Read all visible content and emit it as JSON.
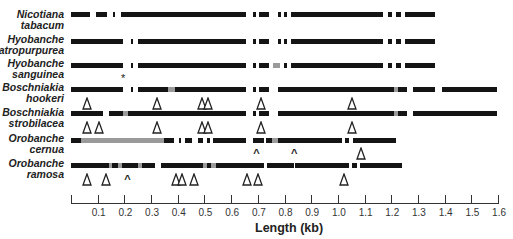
{
  "figure": {
    "xlabel": "Length (kb)",
    "scale": {
      "x0_px": 71,
      "px_per_kb": 266.9
    },
    "axis_ticks": [
      "0.1",
      "0.2",
      "0.3",
      "0.4",
      "0.5",
      "0.6",
      "0.7",
      "0.8",
      "0.9",
      "1.0",
      "1.1",
      "1.2",
      "1.3",
      "1.4",
      "1.5",
      "1.6"
    ],
    "axis_tick_values": [
      0.1,
      0.2,
      0.3,
      0.4,
      0.5,
      0.6,
      0.7,
      0.8,
      0.9,
      1.0,
      1.1,
      1.2,
      1.3,
      1.4,
      1.5,
      1.6
    ]
  },
  "taxa": [
    {
      "genus": "Nicotiana",
      "species": "tabacum",
      "label_top": 9,
      "bar_y": 14,
      "segments": [
        [
          0.0,
          0.09,
          "k"
        ],
        [
          0.115,
          0.165,
          "k"
        ],
        [
          0.195,
          0.205,
          "k"
        ],
        [
          0.23,
          0.4,
          "k"
        ],
        [
          0.4,
          0.81,
          "k"
        ],
        [
          0.84,
          0.855,
          "k"
        ],
        [
          0.87,
          0.915,
          "k"
        ],
        [
          0.955,
          0.97,
          "k"
        ],
        [
          0.985,
          1.0,
          "k"
        ],
        [
          1.015,
          1.04,
          "k"
        ],
        [
          1.04,
          1.44,
          "k"
        ],
        [
          1.465,
          1.485,
          "k"
        ],
        [
          1.5,
          1.525,
          "k"
        ],
        [
          1.545,
          1.68,
          "k"
        ]
      ],
      "markers": []
    },
    {
      "genus": "Hyobanche",
      "species": "atropurpurea",
      "label_top": 34,
      "bar_y": 41,
      "segments": [
        [
          0.0,
          0.24,
          "k"
        ],
        [
          0.275,
          0.285,
          "k"
        ],
        [
          0.31,
          0.49,
          "k"
        ],
        [
          0.49,
          0.81,
          "k"
        ],
        [
          0.84,
          0.855,
          "k"
        ],
        [
          0.87,
          0.915,
          "k"
        ],
        [
          0.955,
          0.97,
          "k"
        ],
        [
          0.985,
          1.0,
          "k"
        ],
        [
          1.015,
          1.04,
          "k"
        ],
        [
          1.04,
          1.44,
          "k"
        ],
        [
          1.465,
          1.485,
          "k"
        ],
        [
          1.5,
          1.525,
          "k"
        ],
        [
          1.545,
          1.68,
          "k"
        ]
      ],
      "markers": []
    },
    {
      "genus": "Hyobanche",
      "species": "sanguinea",
      "label_top": 58,
      "bar_y": 65,
      "segments": [
        [
          0.0,
          0.24,
          "k"
        ],
        [
          0.275,
          0.285,
          "k"
        ],
        [
          0.31,
          0.49,
          "k"
        ],
        [
          0.49,
          0.81,
          "k"
        ],
        [
          0.84,
          0.855,
          "k"
        ],
        [
          0.87,
          0.915,
          "k"
        ],
        [
          0.935,
          0.965,
          "g"
        ],
        [
          0.985,
          1.0,
          "k"
        ],
        [
          1.015,
          1.04,
          "k"
        ],
        [
          1.04,
          1.44,
          "k"
        ],
        [
          1.465,
          1.485,
          "k"
        ],
        [
          1.5,
          1.525,
          "k"
        ],
        [
          1.545,
          1.68,
          "k"
        ]
      ],
      "markers": [
        {
          "type": "star",
          "at": 0.245,
          "y": 73
        }
      ]
    },
    {
      "genus": "Boschniakia",
      "species": "hookeri",
      "label_top": 82,
      "bar_y": 89,
      "segments": [
        [
          0.0,
          0.24,
          "k"
        ],
        [
          0.275,
          0.285,
          "k"
        ],
        [
          0.31,
          0.45,
          "k"
        ],
        [
          0.45,
          0.48,
          "g"
        ],
        [
          0.48,
          0.81,
          "k"
        ],
        [
          0.84,
          0.855,
          "k"
        ],
        [
          0.87,
          0.915,
          "k"
        ],
        [
          0.955,
          1.28,
          "k"
        ],
        [
          1.28,
          1.49,
          "k"
        ],
        [
          1.49,
          1.51,
          "g"
        ],
        [
          1.51,
          1.55,
          "k"
        ],
        [
          1.58,
          1.68,
          "k"
        ],
        [
          1.715,
          1.97,
          "k"
        ]
      ],
      "markers": [
        {
          "type": "tri",
          "at": 0.075,
          "y": 96
        },
        {
          "type": "tri",
          "at": 0.395,
          "y": 96
        },
        {
          "type": "tri",
          "at": 0.605,
          "y": 96
        },
        {
          "type": "tri",
          "at": 0.635,
          "y": 96
        },
        {
          "type": "tri",
          "at": 0.88,
          "y": 96
        },
        {
          "type": "tri",
          "at": 1.3,
          "y": 96
        }
      ]
    },
    {
      "genus": "Boschniakia",
      "species": "strobilacea",
      "label_top": 107,
      "bar_y": 113,
      "segments": [
        [
          0.0,
          0.15,
          "k"
        ],
        [
          0.175,
          0.24,
          "k"
        ],
        [
          0.24,
          0.265,
          "g"
        ],
        [
          0.265,
          0.81,
          "k"
        ],
        [
          0.84,
          0.855,
          "k"
        ],
        [
          0.87,
          0.915,
          "k"
        ],
        [
          0.955,
          1.28,
          "k"
        ],
        [
          1.28,
          1.49,
          "k"
        ],
        [
          1.49,
          1.51,
          "g"
        ],
        [
          1.51,
          1.55,
          "k"
        ],
        [
          1.58,
          1.97,
          "k"
        ]
      ],
      "markers": [
        {
          "type": "tri",
          "at": 0.075,
          "y": 120
        },
        {
          "type": "tri",
          "at": 0.13,
          "y": 120
        },
        {
          "type": "tri",
          "at": 0.395,
          "y": 120
        },
        {
          "type": "tri",
          "at": 0.605,
          "y": 120
        },
        {
          "type": "tri",
          "at": 0.635,
          "y": 120
        },
        {
          "type": "tri",
          "at": 0.88,
          "y": 120
        },
        {
          "type": "tri",
          "at": 1.3,
          "y": 120
        }
      ]
    },
    {
      "genus": "Orobanche",
      "species": "cernua",
      "label_top": 133,
      "bar_y": 140,
      "segments": [
        [
          0.0,
          0.045,
          "k"
        ],
        [
          0.045,
          0.43,
          "g"
        ],
        [
          0.43,
          0.475,
          "k"
        ],
        [
          0.5,
          0.51,
          "k"
        ],
        [
          0.525,
          0.56,
          "k"
        ],
        [
          0.585,
          0.61,
          "k"
        ],
        [
          0.63,
          0.64,
          "k"
        ],
        [
          0.655,
          0.81,
          "k"
        ],
        [
          0.84,
          0.89,
          "k"
        ],
        [
          0.9,
          0.93,
          "k"
        ],
        [
          0.93,
          0.955,
          "g"
        ],
        [
          0.955,
          1.25,
          "k"
        ],
        [
          1.265,
          1.285,
          "k"
        ],
        [
          1.305,
          1.5,
          "k"
        ]
      ],
      "markers": [
        {
          "type": "caret",
          "at": 0.86,
          "y": 148
        },
        {
          "type": "caret",
          "at": 1.035,
          "y": 148
        },
        {
          "type": "tri",
          "at": 1.34,
          "y": 146
        }
      ]
    },
    {
      "genus": "Orobanche",
      "species": "ramosa",
      "label_top": 158,
      "bar_y": 165,
      "segments": [
        [
          0.0,
          0.175,
          "k"
        ],
        [
          0.175,
          0.19,
          "g"
        ],
        [
          0.19,
          0.215,
          "k"
        ],
        [
          0.215,
          0.235,
          "g"
        ],
        [
          0.235,
          0.31,
          "k"
        ],
        [
          0.31,
          0.33,
          "g"
        ],
        [
          0.33,
          0.39,
          "k"
        ],
        [
          0.415,
          0.61,
          "k"
        ],
        [
          0.61,
          0.63,
          "g"
        ],
        [
          0.63,
          0.645,
          "k"
        ],
        [
          0.645,
          0.67,
          "g"
        ],
        [
          0.67,
          0.89,
          "k"
        ],
        [
          0.905,
          1.03,
          "k"
        ],
        [
          1.035,
          1.285,
          "k"
        ],
        [
          1.3,
          1.32,
          "k"
        ],
        [
          1.335,
          1.53,
          "k"
        ]
      ],
      "markers": [
        {
          "type": "tri",
          "at": 0.075,
          "y": 172
        },
        {
          "type": "tri",
          "at": 0.16,
          "y": 172
        },
        {
          "type": "caret",
          "at": 0.265,
          "y": 174
        },
        {
          "type": "tri",
          "at": 0.485,
          "y": 172
        },
        {
          "type": "tri",
          "at": 0.515,
          "y": 172
        },
        {
          "type": "tri",
          "at": 0.57,
          "y": 172
        },
        {
          "type": "tri",
          "at": 0.815,
          "y": 172
        },
        {
          "type": "tri",
          "at": 0.865,
          "y": 172
        },
        {
          "type": "tri",
          "at": 1.26,
          "y": 172
        }
      ]
    }
  ],
  "chart_data": {
    "type": "diagram",
    "title": "",
    "xlabel": "Length (kb)",
    "xlim": [
      0,
      1.6
    ],
    "tick_labels": [
      "0.1",
      "0.2",
      "0.3",
      "0.4",
      "0.5",
      "0.6",
      "0.7",
      "0.8",
      "0.9",
      "1.0",
      "1.1",
      "1.2",
      "1.3",
      "1.4",
      "1.5",
      "1.6"
    ],
    "rows": [
      "Nicotiana tabacum",
      "Hyobanche atropurpurea",
      "Hyobanche sanguinea",
      "Boschniakia hookeri",
      "Boschniakia strobilacea",
      "Orobanche cernua",
      "Orobanche ramosa"
    ],
    "legend_symbols": {
      "black_bar": "sequence present",
      "gray_bar": "divergent region",
      "open_triangle": "insertion",
      "caret": "deletion",
      "asterisk": "stop codon"
    }
  }
}
